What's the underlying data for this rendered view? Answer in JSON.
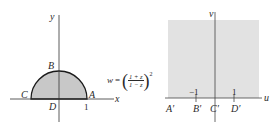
{
  "figure": {
    "left_panel": {
      "name": "z-plane",
      "axis_labels": {
        "x": "x",
        "y": "y"
      },
      "points": [
        {
          "id": "A",
          "label": "A"
        },
        {
          "id": "B",
          "label": "B"
        },
        {
          "id": "C",
          "label": "C"
        },
        {
          "id": "D",
          "label": "D"
        }
      ],
      "tick_labels": [
        "1"
      ],
      "region": "upper half unit disk (shaded)",
      "fill_color": "#c8c8c8",
      "stroke_color": "#1a1a1a"
    },
    "mapping": {
      "lhs": "w",
      "equals": "=",
      "numerator": "1 + z",
      "denominator": "1 − z",
      "exponent": "2"
    },
    "right_panel": {
      "name": "w-plane",
      "axis_labels": {
        "u": "u",
        "v": "v"
      },
      "tick_labels": [
        "−1",
        "1"
      ],
      "points": [
        {
          "id": "A'",
          "label": "A′"
        },
        {
          "id": "B'",
          "label": "B′"
        },
        {
          "id": "C'",
          "label": "C′"
        },
        {
          "id": "D'",
          "label": "D′"
        }
      ],
      "region": "upper half-plane (shaded)",
      "fill_color": "#e2e2e2"
    }
  }
}
